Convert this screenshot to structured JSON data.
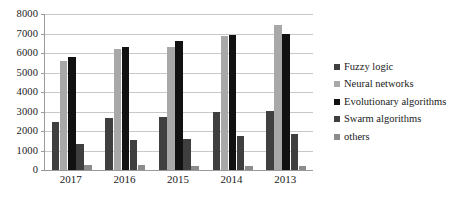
{
  "chart_data": {
    "type": "bar",
    "title": "",
    "xlabel": "",
    "ylabel": "",
    "ylim": [
      0,
      8000
    ],
    "ytick_step": 1000,
    "grid": true,
    "legend_position": "right",
    "categories": [
      "2017",
      "2016",
      "2015",
      "2014",
      "2013"
    ],
    "ytick_labels": [
      "8000",
      "7000",
      "6000",
      "5000",
      "4000",
      "3000",
      "2000",
      "1000",
      "0"
    ],
    "series": [
      {
        "name": "Fuzzy logic",
        "color": "#3f3f3f",
        "values": [
          2480,
          2650,
          2700,
          2980,
          3050
        ]
      },
      {
        "name": "Neural networks",
        "color": "#a8a8a8",
        "values": [
          5600,
          6200,
          6300,
          6880,
          7450
        ]
      },
      {
        "name": "Evolutionary algorithms",
        "color": "#111111",
        "values": [
          5780,
          6300,
          6620,
          6920,
          7000
        ]
      },
      {
        "name": "Swarm algorithms",
        "color": "#3f3f3f",
        "values": [
          1320,
          1540,
          1600,
          1760,
          1850
        ]
      },
      {
        "name": "others",
        "color": "#8c8c8c",
        "values": [
          260,
          250,
          220,
          200,
          190
        ]
      }
    ]
  },
  "legend": {
    "items": [
      {
        "label": "Fuzzy logic",
        "color": "#3f3f3f"
      },
      {
        "label": "Neural networks",
        "color": "#a8a8a8"
      },
      {
        "label": "Evolutionary algorithms",
        "color": "#111111"
      },
      {
        "label": "Swarm algorithms",
        "color": "#3f3f3f"
      },
      {
        "label": "others",
        "color": "#8c8c8c"
      }
    ]
  }
}
